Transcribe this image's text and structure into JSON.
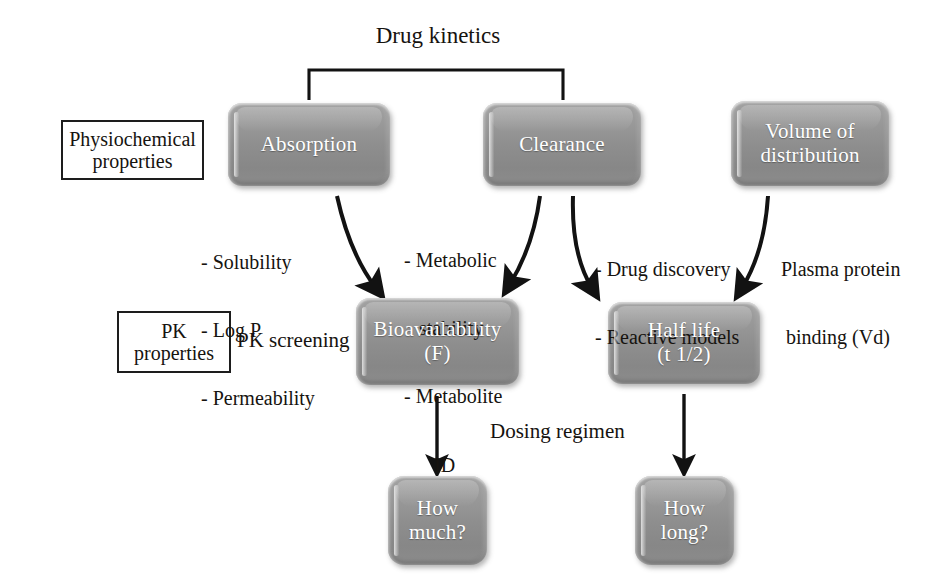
{
  "diagram": {
    "title_bracket_label": "Drug kinetics",
    "dosing_label": "Dosing regimen",
    "pk_screening_label": "PK screening",
    "accent_box_fill": "#8e8e8e",
    "line_color": "#121212",
    "text_color": "#16130f",
    "node_text_color": "#ffffff"
  },
  "row_labels": [
    {
      "id": "physiochemical",
      "line1": "Physiochemical",
      "line2": "properties"
    },
    {
      "id": "pk-properties",
      "line1": "PK",
      "line2": "properties"
    }
  ],
  "nodes": [
    {
      "id": "absorption",
      "line1": "Absorption",
      "line2": ""
    },
    {
      "id": "clearance",
      "line1": "Clearance",
      "line2": ""
    },
    {
      "id": "volume",
      "line1": "Volume of",
      "line2": "distribution"
    },
    {
      "id": "bioavail",
      "line1": "Bioavailability",
      "line2": "(F)"
    },
    {
      "id": "halflife",
      "line1": "Half life",
      "line2": "(t 1/2)"
    },
    {
      "id": "howmuch",
      "line1": "How",
      "line2": "much?"
    },
    {
      "id": "howlong",
      "line1": "How",
      "line2": "long?"
    }
  ],
  "annotations": [
    {
      "id": "absorption-props",
      "lines": [
        "- Solubility",
        "- Log P",
        "- Permeability"
      ]
    },
    {
      "id": "clearance-metabolism",
      "lines": [
        "- Metabolic",
        "   stability",
        "- Metabolite",
        "      ID"
      ]
    },
    {
      "id": "clearance-discovery",
      "lines": [
        "- Drug discovery",
        "- Reactive models"
      ]
    },
    {
      "id": "volume-binding",
      "lines": [
        "Plasma protein",
        " binding (Vd)"
      ]
    }
  ]
}
